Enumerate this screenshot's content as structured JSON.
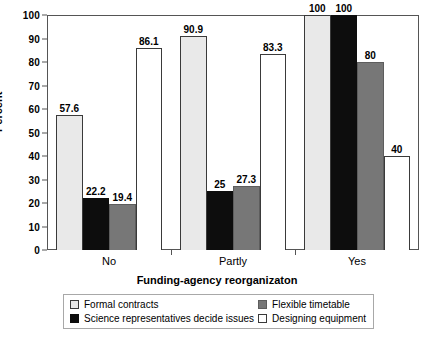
{
  "chart_data": {
    "type": "bar",
    "title": "",
    "subtitle": "",
    "xlabel": "Funding-agency reorganizaton",
    "ylabel": "Percent",
    "categories": [
      "No",
      "Partly",
      "Yes"
    ],
    "ylim": [
      0,
      100
    ],
    "yticks": [
      0,
      10,
      20,
      30,
      40,
      50,
      60,
      70,
      80,
      90,
      100
    ],
    "ytick_labels": [
      "0",
      "10",
      "20",
      "30",
      "40",
      "50",
      "60",
      "70",
      "80",
      "90",
      "100"
    ],
    "grid": true,
    "grid_axis": "y",
    "legend_position": "bottom",
    "value_labels": true,
    "series": [
      {
        "name": "Formal contracts",
        "color": "#e9e9e9",
        "values": [
          57.6,
          90.9,
          100
        ],
        "labels": [
          "57.6",
          "90.9",
          "100"
        ]
      },
      {
        "name": "Science representatives decide issues",
        "color": "#0d0d0d",
        "values": [
          22.2,
          25,
          100
        ],
        "labels": [
          "22.2",
          "25",
          "100"
        ]
      },
      {
        "name": "Flexible timetable",
        "color": "#777777",
        "values": [
          19.4,
          27.3,
          80
        ],
        "labels": [
          "19.4",
          "27.3",
          "80"
        ]
      },
      {
        "name": "Designing equipment",
        "color": "#ffffff",
        "values": [
          86.1,
          83.3,
          40
        ],
        "labels": [
          "86.1",
          "83.3",
          "40"
        ]
      }
    ]
  }
}
